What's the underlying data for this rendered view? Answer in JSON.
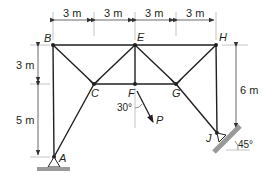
{
  "diagram": {
    "type": "plane truss",
    "nodes": {
      "A": {
        "label": "A"
      },
      "B": {
        "label": "B"
      },
      "C": {
        "label": "C"
      },
      "E": {
        "label": "E"
      },
      "F": {
        "label": "F"
      },
      "G": {
        "label": "G"
      },
      "H": {
        "label": "H"
      },
      "J": {
        "label": "J"
      }
    },
    "members": [
      "AB",
      "AC",
      "BC",
      "BE",
      "CE",
      "CF",
      "EF",
      "EG",
      "FG",
      "EH",
      "GH",
      "HJ",
      "GJ"
    ],
    "dimensions": {
      "top": [
        "3 m",
        "3 m",
        "3 m",
        "3 m"
      ],
      "left_upper": "3 m",
      "left_lower": "5 m",
      "right": "6 m"
    },
    "load": {
      "label": "P",
      "angle_label": "30°",
      "applied_at": "F"
    },
    "supports": {
      "A": "pin on horizontal ground",
      "J": "pin on inclined surface",
      "incline_angle_label": "45°"
    },
    "colors": {
      "member": "#231f20",
      "dim_line": "#555555",
      "ext_line": "#b5b5b5",
      "ground": "#9a9a9a"
    }
  }
}
